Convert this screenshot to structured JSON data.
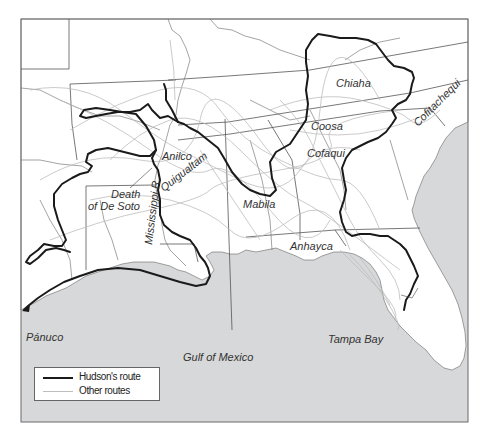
{
  "map": {
    "title": "",
    "colors": {
      "land": "#ffffff",
      "water": "#d7d8d9",
      "frame": "#6a6a6a",
      "borders": "#555555",
      "rivers": "#666666",
      "hudson_route": "#1a1a1a",
      "other_routes": "#bdbdbd"
    },
    "labels": {
      "anilco": "Anilco",
      "quiguate": "Quigualtam",
      "death_of_de_soto_line1": "Death",
      "death_of_de_soto_line2": "of De Soto",
      "mississippi": "Mississippi R.",
      "mabila": "Mabila",
      "chiaha": "Chiaha",
      "coosa": "Coosa",
      "cofaqui": "Cofaqui",
      "cofitachequi": "Cofitachequi",
      "anhayca": "Anhayca",
      "tampa_bay": "Tampa Bay",
      "panuco": "Pánuco",
      "gulf": "Gulf of Mexico"
    },
    "legend": {
      "items": [
        {
          "label": "Hudson's route",
          "style": "thick-black"
        },
        {
          "label": "Other routes",
          "style": "thin-gray"
        }
      ]
    }
  }
}
